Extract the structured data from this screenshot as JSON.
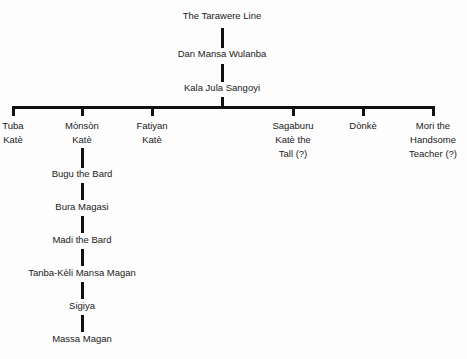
{
  "diagram": {
    "type": "genealogy-tree",
    "root": "The Tarawere Line",
    "lineage": [
      "Dan Mansa Wulanba",
      "Kala Jula Sangoyi"
    ],
    "children": [
      {
        "name": "Tuba Katè",
        "lines": [
          "Tuba",
          "Katè"
        ]
      },
      {
        "name": "Mònsòn Katè",
        "lines": [
          "Mònsòn",
          "Katè"
        ]
      },
      {
        "name": "Fatiyan Katè",
        "lines": [
          "Fatiyan",
          "Katè"
        ]
      },
      {
        "name": "Sagaburu Katè the Tall (?)",
        "lines": [
          "Sagaburu",
          "Katè the",
          "Tall (?)"
        ]
      },
      {
        "name": "Dònkè",
        "lines": [
          "Dònkè"
        ]
      },
      {
        "name": "Mori the Handsome Teacher (?)",
        "lines": [
          "Mori the",
          "Handsome",
          "Teacher (?)"
        ]
      }
    ],
    "monson_descendants": [
      "Bugu the Bard",
      "Bura Magasi",
      "Madi the Bard",
      "Tanba-Kèli Mansa Magan",
      "Sigiya",
      "Massa Magan"
    ]
  }
}
